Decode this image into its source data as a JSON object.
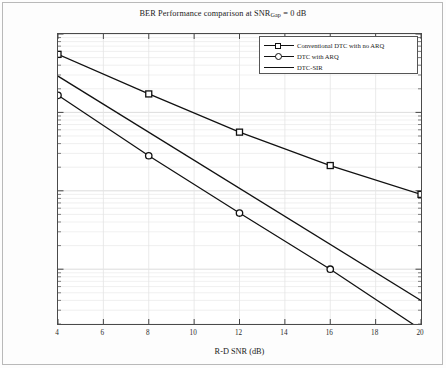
{
  "chart_data": {
    "type": "line",
    "title": "BER Performance comparison at SNR",
    "title_sub": "Gap",
    "title_tail": " = 0 dB",
    "xlabel": "R-D SNR (dB)",
    "ylabel": "BER",
    "xlim": [
      4,
      20
    ],
    "ylim": [
      2e-05,
      0.1
    ],
    "yscale": "log",
    "xticks": [
      4,
      6,
      8,
      10,
      12,
      14,
      16,
      18,
      20
    ],
    "xtick_labels": [
      "4",
      "6",
      "8",
      "10",
      "12",
      "14",
      "16",
      "18",
      "20"
    ],
    "yticks": [
      0.1,
      0.01,
      0.001,
      0.0001
    ],
    "ytick_labels": [
      "10",
      "10",
      "10",
      "10"
    ],
    "ytick_exponents": [
      "-1",
      "-2",
      "-3",
      "-4"
    ],
    "grid": true,
    "legend_position": "upper right",
    "series": [
      {
        "name": "Conventional DTC with no ARQ",
        "marker": "square",
        "x": [
          4,
          8,
          12,
          16,
          20
        ],
        "values": [
          0.055,
          0.0172,
          0.0056,
          0.0021,
          0.0009
        ]
      },
      {
        "name": "DTC with ARQ",
        "marker": "circle",
        "x": [
          4,
          8,
          12,
          16,
          20
        ],
        "values": [
          0.0165,
          0.0028,
          0.00052,
          0.0001,
          1.7e-05
        ]
      },
      {
        "name": "DTC-SIR",
        "marker": "none",
        "x": [
          4,
          20
        ],
        "values": [
          0.029,
          4e-05
        ]
      }
    ]
  },
  "legend": {
    "items": [
      {
        "label": "Conventional DTC with no ARQ",
        "marker": "square"
      },
      {
        "label": "DTC with ARQ",
        "marker": "circle"
      },
      {
        "label": "DTC-SIR",
        "marker": "none"
      }
    ]
  }
}
